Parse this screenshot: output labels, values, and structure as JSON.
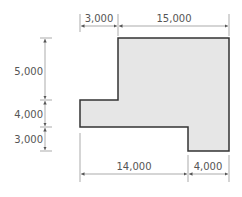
{
  "diagram": {
    "type": "floor-plan-dimensions",
    "shape_fill": "#e6e6e6",
    "shape_stroke": "#333333",
    "dimension_color": "#777777",
    "top_dimensions": [
      {
        "label": "3,000"
      },
      {
        "label": "15,000"
      }
    ],
    "left_dimensions": [
      {
        "label": "5,000"
      },
      {
        "label": "4,000"
      },
      {
        "label": "3,000"
      }
    ],
    "bottom_dimensions": [
      {
        "label": "14,000"
      },
      {
        "label": "4,000"
      }
    ]
  }
}
